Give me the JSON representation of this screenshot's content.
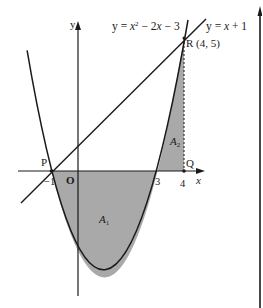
{
  "diagram": {
    "type": "function-graph",
    "axes": {
      "x_label": "x",
      "y_label": "y",
      "origin_label": "O"
    },
    "curves": [
      {
        "name": "parabola",
        "label": "y = x² − 2x − 3",
        "equation": "y = x^2 - 2x - 3"
      },
      {
        "name": "line",
        "label": "y = x + 1",
        "equation": "y = x + 1"
      }
    ],
    "points": [
      {
        "name": "P",
        "label": "P",
        "coords": [
          -1,
          0
        ]
      },
      {
        "name": "Q",
        "label": "Q",
        "coords": [
          4,
          0
        ]
      },
      {
        "name": "R",
        "label": "R (4, 5)",
        "coords": [
          4,
          5
        ]
      }
    ],
    "tick_labels": {
      "neg1": "−1",
      "three": "3",
      "four": "4"
    },
    "regions": [
      {
        "name": "A1",
        "label": "A",
        "subscript": "1",
        "description": "area between parabola and x-axis from x=-1 to x=3"
      },
      {
        "name": "A2",
        "label": "A",
        "subscript": "2",
        "description": "area between parabola and x-axis from x=3 to x=4"
      }
    ],
    "colors": {
      "shade": "#a9a9a9",
      "ink": "#1a1a1a",
      "background": "#ffffff"
    }
  }
}
